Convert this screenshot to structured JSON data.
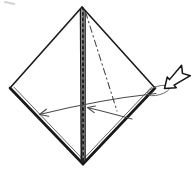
{
  "meta": {
    "background": "#ffffff"
  },
  "colors": {
    "ink": "#1a1a1a",
    "edge": "#222222",
    "inner_layer": "#555555",
    "arrow_line": "#4a4a4a",
    "crease": "#4a4a4a",
    "loop": "#666666",
    "artifact": "#b5b5b5",
    "paper": "#ffffff"
  },
  "canvas": {
    "width": 194,
    "height": 171,
    "viewBox": "0 0 194 171"
  },
  "vertices": {
    "top": [
      82,
      7
    ],
    "right": [
      155,
      88
    ],
    "bottom": [
      83,
      164
    ],
    "left": [
      10,
      88
    ]
  },
  "shapes": [
    {
      "tag": "line",
      "attrs": {
        "data-name": "scan-artifact-mark",
        "data-interactable": "false",
        "x1": "5",
        "y1": "2",
        "x2": "14",
        "y2": "4",
        "stroke": "#b5b5b5",
        "stroke-width": "2",
        "stroke-linecap": "round",
        "opacity": "0.6"
      }
    },
    {
      "tag": "line",
      "attrs": {
        "data-name": "paper-edge-upper-left",
        "data-interactable": "false",
        "x1": "82",
        "y1": "7",
        "x2": "10",
        "y2": "88",
        "stroke": "#1a1a1a",
        "stroke-width": "1.6",
        "stroke-linecap": "round"
      }
    },
    {
      "tag": "line",
      "attrs": {
        "data-name": "paper-edge-upper-right",
        "data-interactable": "false",
        "x1": "82",
        "y1": "7",
        "x2": "155",
        "y2": "88",
        "stroke": "#1a1a1a",
        "stroke-width": "1.6",
        "stroke-linecap": "round"
      }
    },
    {
      "tag": "line",
      "attrs": {
        "data-name": "paper-edge-lower-left-outer",
        "data-interactable": "false",
        "x1": "10",
        "y1": "88",
        "x2": "83",
        "y2": "164",
        "stroke": "#1a1a1a",
        "stroke-width": "2.7",
        "stroke-linecap": "round"
      }
    },
    {
      "tag": "line",
      "attrs": {
        "data-name": "paper-edge-lower-left-inner-layer",
        "data-interactable": "false",
        "x1": "14",
        "y1": "87.2",
        "x2": "84.3",
        "y2": "160.8",
        "stroke": "#555555",
        "stroke-width": "0.9",
        "stroke-linecap": "round"
      }
    },
    {
      "tag": "line",
      "attrs": {
        "data-name": "paper-edge-lower-right-outer",
        "data-interactable": "false",
        "x1": "155",
        "y1": "88",
        "x2": "83",
        "y2": "164",
        "stroke": "#1a1a1a",
        "stroke-width": "2.7",
        "stroke-linecap": "round"
      }
    },
    {
      "tag": "line",
      "attrs": {
        "data-name": "paper-edge-lower-right-inner-layer",
        "data-interactable": "false",
        "x1": "151.5",
        "y1": "87.2",
        "x2": "81.5",
        "y2": "161",
        "stroke": "#555555",
        "stroke-width": "0.9",
        "stroke-linecap": "round"
      }
    },
    {
      "tag": "line",
      "attrs": {
        "data-name": "center-layered-edge-left",
        "data-interactable": "false",
        "x1": "80.5",
        "y1": "9",
        "x2": "81.3",
        "y2": "162",
        "stroke": "#1a1a1a",
        "stroke-width": "1.5"
      }
    },
    {
      "tag": "line",
      "attrs": {
        "data-name": "center-layered-edge-middle",
        "data-interactable": "false",
        "x1": "82.8",
        "y1": "7.5",
        "x2": "83.2",
        "y2": "163",
        "stroke": "#1f1f1f",
        "stroke-width": "2.1"
      }
    },
    {
      "tag": "line",
      "attrs": {
        "data-name": "center-layered-edge-middle-flecks",
        "data-interactable": "false",
        "x1": "82.8",
        "y1": "10",
        "x2": "83.2",
        "y2": "160",
        "stroke": "#ffffff",
        "stroke-width": "0.8",
        "stroke-dasharray": "2.2 3.4",
        "opacity": "0.85"
      }
    },
    {
      "tag": "line",
      "attrs": {
        "data-name": "center-layered-edge-right",
        "data-interactable": "false",
        "x1": "85.1",
        "y1": "10",
        "x2": "85.1",
        "y2": "160",
        "stroke": "#1a1a1a",
        "stroke-width": "1.4"
      }
    },
    {
      "tag": "line",
      "attrs": {
        "data-name": "crease-dash-dot-line",
        "data-interactable": "false",
        "x1": "85.5",
        "y1": "12",
        "x2": "117",
        "y2": "111",
        "stroke": "#4a4a4a",
        "stroke-width": "1.1",
        "stroke-dasharray": "6.5 3.5 1.3 3.5",
        "stroke-linecap": "round"
      }
    },
    {
      "tag": "ellipse",
      "attrs": {
        "data-name": "corner-wrap-loop",
        "data-interactable": "false",
        "cx": "158.5",
        "cy": "90.5",
        "rx": "11.5",
        "ry": "4.3",
        "fill": "none",
        "stroke": "#666666",
        "stroke-width": "0.9",
        "transform": "rotate(-16 158.5 90.5)"
      }
    },
    {
      "tag": "path",
      "attrs": {
        "data-name": "fold-arrow-long-arc",
        "data-interactable": "false",
        "d": "M 156 93.5 Q 100 99.5 39.5 114.5",
        "fill": "none",
        "stroke": "#4a4a4a",
        "stroke-width": "1.05",
        "stroke-linecap": "round"
      }
    },
    {
      "tag": "polyline",
      "attrs": {
        "data-name": "fold-arrow-long-arrowhead",
        "data-interactable": "false",
        "points": "48.6,116.3 39.5,114.5 46.4,109.2",
        "fill": "none",
        "stroke": "#4a4a4a",
        "stroke-width": "1.15",
        "stroke-linecap": "round",
        "stroke-linejoin": "round"
      }
    },
    {
      "tag": "path",
      "attrs": {
        "data-name": "fold-arrow-short-arc",
        "data-interactable": "false",
        "d": "M 132 119 Q 108 112.5 87.5 107.5",
        "fill": "none",
        "stroke": "#4a4a4a",
        "stroke-width": "1.05",
        "stroke-linecap": "round"
      }
    },
    {
      "tag": "polyline",
      "attrs": {
        "data-name": "fold-arrow-short-arrowhead",
        "data-interactable": "false",
        "points": "94.2,112.6 87.5,107.5 95.4,106 ",
        "fill": "none",
        "stroke": "#4a4a4a",
        "stroke-width": "1.15",
        "stroke-linecap": "round",
        "stroke-linejoin": "round"
      }
    },
    {
      "tag": "polygon",
      "attrs": {
        "data-name": "push-hollow-arrow",
        "data-interactable": "false",
        "points": "0,0 9.5,-7 9.5,-3.6 28,-6.8 23.5,0 28,6.8 9.5,3.6 9.5,7",
        "fill": "#ffffff",
        "stroke": "#141414",
        "stroke-width": "1.5",
        "stroke-linejoin": "round",
        "transform": "translate(164.5,88.5) rotate(-40)"
      }
    }
  ]
}
